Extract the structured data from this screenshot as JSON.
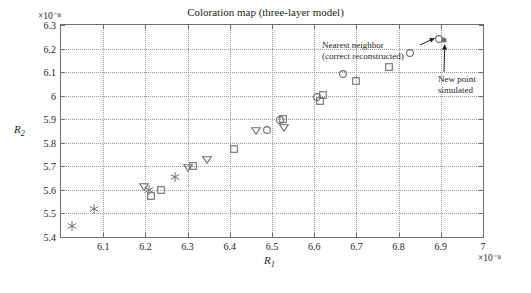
{
  "chart_data": {
    "type": "scatter",
    "title": "Coloration map (three-layer model)",
    "xlabel": "R1",
    "ylabel": "R2",
    "x_exponent": "×10⁻⁸",
    "y_exponent": "×10⁻⁸",
    "xlim": [
      6.0,
      7.0
    ],
    "ylim": [
      5.4,
      6.3
    ],
    "xticks": [
      "6.1",
      "6.2",
      "6.3",
      "6.4",
      "6.5",
      "6.6",
      "6.7",
      "6.8",
      "6.9",
      "7"
    ],
    "xtick_values": [
      6.1,
      6.2,
      6.3,
      6.4,
      6.5,
      6.6,
      6.7,
      6.8,
      6.9,
      7.0
    ],
    "yticks": [
      "5.4",
      "5.5",
      "5.6",
      "5.7",
      "5.8",
      "5.9",
      "6",
      "6.1",
      "6.2",
      "6.3"
    ],
    "ytick_values": [
      5.4,
      5.5,
      5.6,
      5.7,
      5.8,
      5.9,
      6.0,
      6.1,
      6.2,
      6.3
    ],
    "grid": true,
    "legend": "none",
    "marker_color": "#6d6e71",
    "series": [
      {
        "name": "samples",
        "points": [
          {
            "x": 6.025,
            "y": 5.448,
            "marker": "star"
          },
          {
            "x": 6.078,
            "y": 5.517,
            "marker": "star"
          },
          {
            "x": 6.197,
            "y": 5.612,
            "marker": "triangle-down"
          },
          {
            "x": 6.208,
            "y": 5.6,
            "marker": "star"
          },
          {
            "x": 6.213,
            "y": 5.575,
            "marker": "square"
          },
          {
            "x": 6.238,
            "y": 5.601,
            "marker": "square"
          },
          {
            "x": 6.27,
            "y": 5.655,
            "marker": "star"
          },
          {
            "x": 6.3,
            "y": 5.692,
            "marker": "triangle-down"
          },
          {
            "x": 6.313,
            "y": 5.7,
            "marker": "square"
          },
          {
            "x": 6.345,
            "y": 5.725,
            "marker": "triangle-down"
          },
          {
            "x": 6.41,
            "y": 5.772,
            "marker": "square"
          },
          {
            "x": 6.462,
            "y": 5.848,
            "marker": "triangle-down"
          },
          {
            "x": 6.487,
            "y": 5.853,
            "marker": "circle"
          },
          {
            "x": 6.519,
            "y": 5.898,
            "marker": "circle"
          },
          {
            "x": 6.526,
            "y": 5.9,
            "marker": "square"
          },
          {
            "x": 6.528,
            "y": 5.861,
            "marker": "triangle-down"
          },
          {
            "x": 6.607,
            "y": 5.993,
            "marker": "circle"
          },
          {
            "x": 6.613,
            "y": 5.978,
            "marker": "square"
          },
          {
            "x": 6.62,
            "y": 6.002,
            "marker": "square"
          },
          {
            "x": 6.668,
            "y": 6.093,
            "marker": "circle"
          },
          {
            "x": 6.7,
            "y": 6.063,
            "marker": "square"
          },
          {
            "x": 6.778,
            "y": 6.123,
            "marker": "square"
          },
          {
            "x": 6.828,
            "y": 6.182,
            "marker": "circle"
          },
          {
            "x": 6.895,
            "y": 6.24,
            "marker": "circle"
          },
          {
            "x": 6.907,
            "y": 6.238,
            "marker": "dot"
          }
        ]
      }
    ],
    "annotations": [
      {
        "name": "nearest-neighbor",
        "line1": "Nearest neighbor",
        "line2": "(correct reconstructed)",
        "points_to": {
          "x": 6.895,
          "y": 6.24
        }
      },
      {
        "name": "new-point",
        "line1": "New point",
        "line2": "simulated",
        "points_to": {
          "x": 6.907,
          "y": 6.238
        }
      }
    ]
  }
}
